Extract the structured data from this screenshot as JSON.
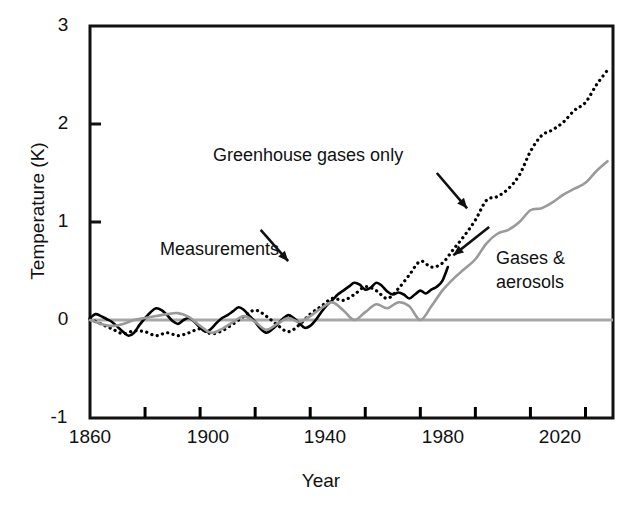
{
  "chart_data": {
    "type": "line",
    "title": "",
    "xlabel": "Year",
    "ylabel": "Temperature (K)",
    "xlim": [
      1860,
      2050
    ],
    "ylim": [
      -1,
      3
    ],
    "xticks": [
      1860,
      1880,
      1900,
      1920,
      1940,
      1960,
      1980,
      2000,
      2020,
      2040
    ],
    "xticklabels": [
      "1860",
      "",
      "1900",
      "",
      "1940",
      "",
      "1980",
      "",
      "2020",
      ""
    ],
    "yticks": [
      -1,
      0,
      1,
      2,
      3
    ],
    "yticklabels": [
      "-1",
      "0",
      "1",
      "2",
      "3"
    ],
    "grid": false,
    "legend_position": "inline-annotations",
    "zero_line": {
      "value": 0,
      "color": "#a8a8a8",
      "width": 3
    },
    "series": [
      {
        "name": "Measurements",
        "style": "solid",
        "color": "#000000",
        "width": 2.6,
        "x": [
          1860,
          1862,
          1864,
          1866,
          1868,
          1870,
          1872,
          1874,
          1876,
          1878,
          1880,
          1882,
          1884,
          1886,
          1888,
          1890,
          1892,
          1894,
          1896,
          1898,
          1900,
          1902,
          1904,
          1906,
          1908,
          1910,
          1912,
          1914,
          1916,
          1918,
          1920,
          1922,
          1924,
          1926,
          1928,
          1930,
          1932,
          1934,
          1936,
          1938,
          1940,
          1942,
          1944,
          1946,
          1948,
          1950,
          1952,
          1954,
          1956,
          1958,
          1960,
          1962,
          1964,
          1966,
          1968,
          1970,
          1972,
          1974,
          1976,
          1978,
          1980,
          1982,
          1984,
          1986,
          1988,
          1990
        ],
        "y": [
          0.02,
          0.06,
          0.04,
          0.01,
          -0.02,
          -0.07,
          -0.12,
          -0.16,
          -0.13,
          -0.05,
          0.02,
          0.08,
          0.12,
          0.1,
          0.05,
          -0.01,
          -0.04,
          0.0,
          0.02,
          -0.02,
          -0.08,
          -0.12,
          -0.09,
          -0.03,
          0.02,
          0.05,
          0.09,
          0.13,
          0.1,
          0.04,
          -0.02,
          -0.09,
          -0.13,
          -0.1,
          -0.05,
          0.01,
          0.05,
          0.02,
          -0.03,
          -0.08,
          -0.06,
          0.0,
          0.08,
          0.15,
          0.2,
          0.26,
          0.3,
          0.34,
          0.38,
          0.36,
          0.31,
          0.33,
          0.38,
          0.35,
          0.29,
          0.26,
          0.28,
          0.26,
          0.22,
          0.26,
          0.3,
          0.27,
          0.31,
          0.34,
          0.4,
          0.54
        ],
        "annotation": {
          "label": "Measurements",
          "label_x": 1893,
          "label_y": 1.08,
          "arrow_to_x": 1929,
          "arrow_to_y": 0.52
        }
      },
      {
        "name": "Greenhouse gases only",
        "style": "dotted",
        "color": "#000000",
        "width": 3.2,
        "x": [
          1860,
          1864,
          1868,
          1872,
          1876,
          1880,
          1884,
          1888,
          1892,
          1896,
          1900,
          1904,
          1908,
          1912,
          1916,
          1920,
          1924,
          1928,
          1932,
          1936,
          1940,
          1944,
          1948,
          1952,
          1956,
          1960,
          1964,
          1968,
          1972,
          1976,
          1980,
          1984,
          1988,
          1992,
          1996,
          2000,
          2004,
          2008,
          2012,
          2016,
          2020,
          2024,
          2028,
          2032,
          2036,
          2040,
          2044,
          2048
        ],
        "y": [
          0.01,
          -0.04,
          -0.09,
          -0.14,
          -0.11,
          -0.12,
          -0.16,
          -0.13,
          -0.16,
          -0.13,
          -0.09,
          -0.14,
          -0.11,
          -0.04,
          0.04,
          0.1,
          0.04,
          -0.05,
          -0.12,
          -0.05,
          0.06,
          0.14,
          0.22,
          0.2,
          0.26,
          0.34,
          0.3,
          0.22,
          0.32,
          0.46,
          0.6,
          0.54,
          0.58,
          0.72,
          0.86,
          1.02,
          1.22,
          1.26,
          1.34,
          1.48,
          1.72,
          1.88,
          1.94,
          2.02,
          2.14,
          2.22,
          2.4,
          2.55
        ],
        "annotation": {
          "label": "Greenhouse gases only",
          "label_x": 1925,
          "label_y": 1.58,
          "arrow_to_x": 1998,
          "arrow_to_y": 1.12
        }
      },
      {
        "name": "Gases & aerosols",
        "style": "solid",
        "color": "#9a9a9a",
        "width": 2.6,
        "x": [
          1860,
          1864,
          1868,
          1872,
          1876,
          1880,
          1884,
          1888,
          1892,
          1896,
          1900,
          1904,
          1908,
          1912,
          1916,
          1920,
          1924,
          1928,
          1932,
          1936,
          1940,
          1944,
          1948,
          1952,
          1956,
          1960,
          1964,
          1968,
          1972,
          1976,
          1980,
          1984,
          1988,
          1992,
          1996,
          2000,
          2004,
          2008,
          2012,
          2016,
          2020,
          2024,
          2028,
          2032,
          2036,
          2040,
          2044,
          2048
        ],
        "y": [
          0.0,
          -0.04,
          -0.06,
          -0.04,
          0.0,
          0.02,
          0.04,
          0.06,
          0.07,
          0.03,
          -0.06,
          -0.13,
          -0.09,
          -0.02,
          0.04,
          -0.02,
          -0.1,
          -0.04,
          0.02,
          -0.02,
          0.04,
          0.12,
          0.18,
          0.1,
          0.0,
          0.08,
          0.16,
          0.12,
          0.18,
          0.14,
          0.0,
          0.14,
          0.3,
          0.42,
          0.52,
          0.62,
          0.78,
          0.88,
          0.92,
          1.0,
          1.12,
          1.14,
          1.2,
          1.28,
          1.34,
          1.4,
          1.52,
          1.62
        ],
        "annotation": {
          "label_line1": "Gases &",
          "label_line2": "aerosols",
          "label_x": 2008,
          "label_y": 0.88,
          "arrow_to_x": 1988,
          "arrow_to_y": 0.6
        }
      }
    ],
    "annotations": [
      {
        "name": "measurements-label",
        "text": "Measurements"
      },
      {
        "name": "greenhouse-gases-label",
        "text": "Greenhouse gases only"
      },
      {
        "name": "gases-aerosols-label-line1",
        "text": "Gases &"
      },
      {
        "name": "gases-aerosols-label-line2",
        "text": "aerosols"
      }
    ]
  },
  "axes": {
    "ylabel": "Temperature (K)",
    "xlabel": "Year",
    "ytick_0": "3",
    "ytick_1": "2",
    "ytick_2": "1",
    "ytick_3": "0",
    "ytick_4": "-1",
    "xtick_0": "1860",
    "xtick_1": "1900",
    "xtick_2": "1940",
    "xtick_3": "1980",
    "xtick_4": "2020"
  },
  "labels": {
    "measurements": "Measurements",
    "greenhouse": "Greenhouse gases only",
    "aerosols_1": "Gases &",
    "aerosols_2": "aerosols"
  },
  "colors": {
    "measurements": "#000000",
    "greenhouse": "#000000",
    "aerosols": "#9a9a9a",
    "zero_line": "#a8a8a8",
    "axis": "#111111"
  }
}
